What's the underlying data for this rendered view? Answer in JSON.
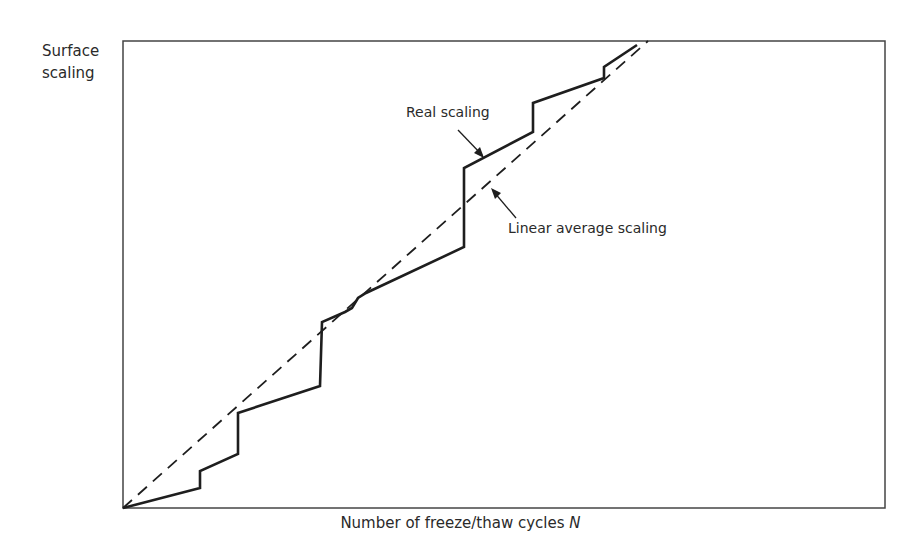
{
  "chart_data": {
    "type": "line",
    "title": "",
    "xlabel": "Number of freeze/thaw cycles N",
    "xlabel_plain": "Number of freeze/thaw cycles",
    "xlabel_var": "N",
    "ylabel": "Surface scaling",
    "ylabel_lines": [
      "Surface",
      "scaling"
    ],
    "grid": false,
    "axis_ticks": "none",
    "series": [
      {
        "name": "Real scaling",
        "style": "solid",
        "points_px": [
          [
            123,
            508
          ],
          [
            200,
            488
          ],
          [
            200,
            471
          ],
          [
            238,
            454
          ],
          [
            238,
            413
          ],
          [
            320,
            386
          ],
          [
            322,
            322
          ],
          [
            345,
            312
          ],
          [
            352,
            308
          ],
          [
            358,
            298
          ],
          [
            366,
            293
          ],
          [
            464,
            247
          ],
          [
            464,
            168
          ],
          [
            533,
            132
          ],
          [
            533,
            103
          ],
          [
            604,
            78
          ],
          [
            604,
            67
          ],
          [
            637,
            45
          ]
        ]
      },
      {
        "name": "Linear average scaling",
        "style": "dashed",
        "points_px": [
          [
            123,
            508
          ],
          [
            648,
            41
          ]
        ]
      }
    ],
    "annotations": [
      {
        "text": "Real scaling",
        "arrow_to_px": [
          484,
          157
        ]
      },
      {
        "text": "Linear average scaling",
        "arrow_to_px": [
          492,
          189
        ]
      }
    ],
    "plot_box_px": {
      "left": 123,
      "top": 41,
      "right": 885,
      "bottom": 508
    }
  }
}
